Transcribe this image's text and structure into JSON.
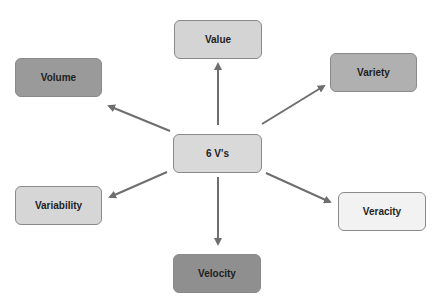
{
  "diagram": {
    "center": {
      "label": "6 V's",
      "color": "#d9d9d9"
    },
    "nodes": [
      {
        "id": "value",
        "label": "Value",
        "color": "#d4d4d4"
      },
      {
        "id": "volume",
        "label": "Volume",
        "color": "#9a9a9a"
      },
      {
        "id": "variety",
        "label": "Variety",
        "color": "#b0b0b0"
      },
      {
        "id": "variability",
        "label": "Variability",
        "color": "#d6d6d6"
      },
      {
        "id": "veracity",
        "label": "Veracity",
        "color": "#f2f2f2"
      },
      {
        "id": "velocity",
        "label": "Velocity",
        "color": "#8f8f8f"
      }
    ],
    "arrow_color": "#6e6e6e"
  }
}
